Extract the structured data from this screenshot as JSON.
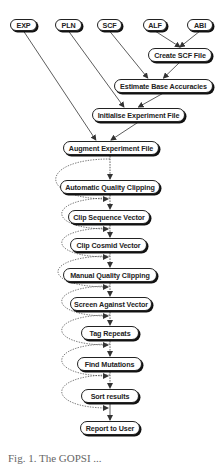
{
  "diagram": {
    "inputs": [
      {
        "id": "exp",
        "label": "EXP",
        "x": 10,
        "y": 19,
        "w": 27,
        "h": 12
      },
      {
        "id": "pln",
        "label": "PLN",
        "x": 55,
        "y": 19,
        "w": 27,
        "h": 12
      },
      {
        "id": "scf",
        "label": "SCF",
        "x": 97,
        "y": 19,
        "w": 25,
        "h": 12
      },
      {
        "id": "alf",
        "label": "ALF",
        "x": 143,
        "y": 19,
        "w": 24,
        "h": 12
      },
      {
        "id": "abi",
        "label": "ABI",
        "x": 187,
        "y": 19,
        "w": 26,
        "h": 12
      }
    ],
    "steps": [
      {
        "id": "create_scf",
        "label": "Create SCF File",
        "x": 148,
        "y": 48,
        "w": 64,
        "h": 14
      },
      {
        "id": "estimate",
        "label": "Estimate Base Accuracies",
        "x": 114,
        "y": 79,
        "w": 99,
        "h": 14
      },
      {
        "id": "initialise",
        "label": "Initialise Experiment File",
        "x": 92,
        "y": 108,
        "w": 93,
        "h": 14
      },
      {
        "id": "augment",
        "label": "Augment Experiment File",
        "x": 63,
        "y": 141,
        "w": 96,
        "h": 14
      },
      {
        "id": "auto_clip",
        "label": "Automatic Quality Clipping",
        "x": 60,
        "y": 180,
        "w": 100,
        "h": 14
      },
      {
        "id": "clip_seq",
        "label": "Clip Sequence Vector",
        "x": 68,
        "y": 210,
        "w": 82,
        "h": 14
      },
      {
        "id": "clip_cos",
        "label": "Clip Cosmid Vector",
        "x": 70,
        "y": 238,
        "w": 77,
        "h": 14
      },
      {
        "id": "manual_clip",
        "label": "Manual Quality Clipping",
        "x": 63,
        "y": 268,
        "w": 94,
        "h": 14
      },
      {
        "id": "screen",
        "label": "Screen Against Vector",
        "x": 70,
        "y": 297,
        "w": 82,
        "h": 14
      },
      {
        "id": "tag",
        "label": "Tag Repeats",
        "x": 81,
        "y": 326,
        "w": 58,
        "h": 14
      },
      {
        "id": "mutations",
        "label": "Find Mutations",
        "x": 77,
        "y": 357,
        "w": 65,
        "h": 14
      },
      {
        "id": "sort",
        "label": "Sort results",
        "x": 81,
        "y": 389,
        "w": 58,
        "h": 14
      },
      {
        "id": "report",
        "label": "Report to User",
        "x": 80,
        "y": 421,
        "w": 60,
        "h": 14
      }
    ],
    "edges": [
      {
        "from": "alf",
        "to": "create_scf",
        "style": "solid"
      },
      {
        "from": "abi",
        "to": "create_scf",
        "style": "solid"
      },
      {
        "from": "scf",
        "to": "estimate",
        "style": "solid"
      },
      {
        "from": "create_scf",
        "to": "estimate",
        "style": "solid"
      },
      {
        "from": "pln",
        "to": "initialise",
        "style": "solid"
      },
      {
        "from": "estimate",
        "to": "initialise",
        "style": "solid"
      },
      {
        "from": "exp",
        "to": "augment",
        "style": "solid"
      },
      {
        "from": "initialise",
        "to": "augment",
        "style": "solid"
      },
      {
        "from": "augment",
        "to": "auto_clip",
        "style": "dashed-bypass"
      },
      {
        "from": "auto_clip",
        "to": "clip_seq",
        "style": "dashed-bypass"
      },
      {
        "from": "clip_seq",
        "to": "clip_cos",
        "style": "dashed-bypass"
      },
      {
        "from": "clip_cos",
        "to": "manual_clip",
        "style": "dashed-bypass"
      },
      {
        "from": "manual_clip",
        "to": "screen",
        "style": "dashed-bypass"
      },
      {
        "from": "screen",
        "to": "tag",
        "style": "dashed-bypass"
      },
      {
        "from": "tag",
        "to": "mutations",
        "style": "dashed-bypass"
      },
      {
        "from": "mutations",
        "to": "sort",
        "style": "dashed-bypass"
      },
      {
        "from": "sort",
        "to": "report",
        "style": "solid"
      }
    ]
  },
  "caption": {
    "text": "Fig. 1. The GOPSI ..."
  }
}
